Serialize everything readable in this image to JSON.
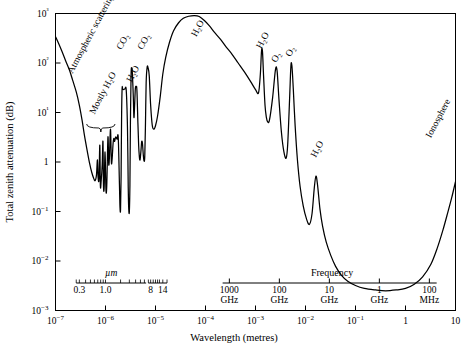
{
  "chart_data": {
    "type": "line",
    "title": "",
    "xlabel": "Wavelength (metres)",
    "ylabel": "Total zenith attenuation (dB)",
    "xscale": "log",
    "yscale": "log",
    "xlim": [
      1e-07,
      10
    ],
    "ylim": [
      0.001,
      1000
    ],
    "grid": false,
    "legend": "none",
    "x_tick_labels": [
      "10−7",
      "10−6",
      "10−5",
      "10−4",
      "10−3",
      "10−2",
      "10−1",
      "1",
      "10"
    ],
    "x_tick_values": [
      1e-07,
      1e-06,
      1e-05,
      0.0001,
      0.001,
      0.01,
      0.1,
      1,
      10
    ],
    "y_tick_labels": [
      "10−3",
      "10−2",
      "10−1",
      "1",
      "10¹",
      "10²",
      "10³"
    ],
    "y_tick_values": [
      0.001,
      0.01,
      0.1,
      1,
      10,
      100,
      1000
    ],
    "secondary_axes": [
      {
        "name": "micrometre-scale",
        "label": "µm",
        "ticks": [
          {
            "label": "0.3",
            "wavelength": 3e-07
          },
          {
            "label": "1.0",
            "wavelength": 1e-06
          },
          {
            "label": "8",
            "wavelength": 8e-06
          },
          {
            "label": "14",
            "wavelength": 1.4e-05
          }
        ]
      },
      {
        "name": "frequency-scale",
        "label": "Frequency",
        "ticks": [
          {
            "label": "1000",
            "unit": "GHz",
            "wavelength": 0.0003
          },
          {
            "label": "100",
            "unit": "GHz",
            "wavelength": 0.003
          },
          {
            "label": "10",
            "unit": "GHz",
            "wavelength": 0.03
          },
          {
            "label": "1",
            "unit": "GHz",
            "wavelength": 0.3
          },
          {
            "label": "100",
            "unit": "MHz",
            "wavelength": 3.0
          }
        ]
      }
    ],
    "annotations": [
      {
        "text": "Atmospheric scattering",
        "name": "annotation-atmospheric-scattering",
        "x": 2.2e-07,
        "y": 60,
        "rotate": -62
      },
      {
        "text": "Mostly H₂O",
        "name": "annotation-mostly-h2o",
        "x": 6e-07,
        "y": 9,
        "rotate": -62
      },
      {
        "text": "CO₂",
        "name": "annotation-co2-1",
        "x": 2.1e-06,
        "y": 180,
        "rotate": -62
      },
      {
        "text": "H₂O",
        "name": "annotation-h2o-ir",
        "x": 3.3e-06,
        "y": 40,
        "rotate": -62
      },
      {
        "text": "CO₂",
        "name": "annotation-co2-2",
        "x": 5.5e-06,
        "y": 180,
        "rotate": -62
      },
      {
        "text": "H₂O",
        "name": "annotation-h2o-submm",
        "x": 6.5e-05,
        "y": 330,
        "rotate": -62
      },
      {
        "text": "H₂O",
        "name": "annotation-h2o-183",
        "x": 0.0013,
        "y": 190,
        "rotate": -62
      },
      {
        "text": "O₂",
        "name": "annotation-o2-1",
        "x": 0.0026,
        "y": 100,
        "rotate": -62
      },
      {
        "text": "O₂",
        "name": "annotation-o2-2",
        "x": 0.005,
        "y": 130,
        "rotate": -62
      },
      {
        "text": "H₂O",
        "name": "annotation-h2o-22",
        "x": 0.016,
        "y": 1.2,
        "rotate": -62
      },
      {
        "text": "Ionosphere",
        "name": "annotation-ionosphere",
        "x": 3.2,
        "y": 3.0,
        "rotate": -62
      }
    ],
    "series": [
      {
        "name": "Total zenith attenuation",
        "points": [
          [
            1e-07,
            340
          ],
          [
            1.15e-07,
            250
          ],
          [
            1.35e-07,
            170
          ],
          [
            1.6e-07,
            110
          ],
          [
            1.9e-07,
            72
          ],
          [
            2.2e-07,
            45
          ],
          [
            2.6e-07,
            26
          ],
          [
            3e-07,
            14
          ],
          [
            3.4e-07,
            7.0
          ],
          [
            3.8e-07,
            3.4
          ],
          [
            4.3e-07,
            1.7
          ],
          [
            4.8e-07,
            0.95
          ],
          [
            5.3e-07,
            0.62
          ],
          [
            5.8e-07,
            0.47
          ],
          [
            6.2e-07,
            0.42
          ],
          [
            6.6e-07,
            0.55
          ],
          [
            6.9e-07,
            1.1
          ],
          [
            7.1e-07,
            0.5
          ],
          [
            7.4e-07,
            0.45
          ],
          [
            7.7e-07,
            2.2
          ],
          [
            7.9e-07,
            0.33
          ],
          [
            8.2e-07,
            0.42
          ],
          [
            8.6e-07,
            0.9
          ],
          [
            8.9e-07,
            2.6
          ],
          [
            9.1e-07,
            0.35
          ],
          [
            9.4e-07,
            0.3
          ],
          [
            9.8e-07,
            1.6
          ],
          [
            1.02e-06,
            0.28
          ],
          [
            1.06e-06,
            0.33
          ],
          [
            1.12e-06,
            3.2
          ],
          [
            1.16e-06,
            0.9
          ],
          [
            1.2e-06,
            1.3
          ],
          [
            1.26e-06,
            4.6
          ],
          [
            1.31e-06,
            1.0
          ],
          [
            1.36e-06,
            1.2
          ],
          [
            1.42e-06,
            2.4
          ],
          [
            1.47e-06,
            3.0
          ],
          [
            1.52e-06,
            2.6
          ],
          [
            1.6e-06,
            3.2
          ],
          [
            1.7e-06,
            2.9
          ],
          [
            1.8e-06,
            3.1
          ],
          [
            1.9e-06,
            0.35
          ],
          [
            1.95e-06,
            0.12
          ],
          [
            2e-06,
            0.11
          ],
          [
            2.05e-06,
            0.5
          ],
          [
            2.1e-06,
            9
          ],
          [
            2.15e-06,
            31
          ],
          [
            2.2e-06,
            30
          ],
          [
            2.3e-06,
            29
          ],
          [
            2.45e-06,
            30
          ],
          [
            2.6e-06,
            28
          ],
          [
            2.75e-06,
            5.0
          ],
          [
            2.85e-06,
            0.3
          ],
          [
            2.92e-06,
            0.11
          ],
          [
            3e-06,
            0.1
          ],
          [
            3.08e-06,
            0.35
          ],
          [
            3.15e-06,
            6
          ],
          [
            3.25e-06,
            60
          ],
          [
            3.35e-06,
            78
          ],
          [
            3.45e-06,
            62
          ],
          [
            3.6e-06,
            20
          ],
          [
            3.7e-06,
            8
          ],
          [
            3.8e-06,
            12
          ],
          [
            3.95e-06,
            30
          ],
          [
            4.1e-06,
            33
          ],
          [
            4.25e-06,
            28
          ],
          [
            4.45e-06,
            6
          ],
          [
            4.6e-06,
            2.2
          ],
          [
            4.75e-06,
            1.3
          ],
          [
            4.9e-06,
            1.1
          ],
          [
            5.1e-06,
            1.6
          ],
          [
            5.3e-06,
            2.6
          ],
          [
            5.5e-06,
            2.3
          ],
          [
            5.7e-06,
            1.4
          ],
          [
            5.9e-06,
            1.05
          ],
          [
            6.1e-06,
            1.3
          ],
          [
            6.3e-06,
            6
          ],
          [
            6.5e-06,
            40
          ],
          [
            6.8e-06,
            82
          ],
          [
            7.1e-06,
            80
          ],
          [
            7.5e-06,
            55
          ],
          [
            8e-06,
            14
          ],
          [
            8.6e-06,
            5.6
          ],
          [
            9.2e-06,
            4.6
          ],
          [
            1e-05,
            5.4
          ],
          [
            1.1e-05,
            8.5
          ],
          [
            1.25e-05,
            22
          ],
          [
            1.4e-05,
            60
          ],
          [
            1.6e-05,
            130
          ],
          [
            1.9e-05,
            260
          ],
          [
            2.3e-05,
            450
          ],
          [
            2.9e-05,
            650
          ],
          [
            3.6e-05,
            800
          ],
          [
            4.6e-05,
            880
          ],
          [
            6e-05,
            910
          ],
          [
            7.5e-05,
            870
          ],
          [
            9.5e-05,
            720
          ],
          [
            0.00012,
            560
          ],
          [
            0.00015,
            420
          ],
          [
            0.0002,
            300
          ],
          [
            0.00026,
            210
          ],
          [
            0.00034,
            150
          ],
          [
            0.00045,
            100
          ],
          [
            0.0006,
            66
          ],
          [
            0.0008,
            42
          ],
          [
            0.001,
            29
          ],
          [
            0.00115,
            25
          ],
          [
            0.00125,
            60
          ],
          [
            0.00132,
            175
          ],
          [
            0.00138,
            170
          ],
          [
            0.00145,
            55
          ],
          [
            0.00155,
            14
          ],
          [
            0.00165,
            8
          ],
          [
            0.00175,
            6.5
          ],
          [
            0.0019,
            7
          ],
          [
            0.0022,
            20
          ],
          [
            0.0025,
            72
          ],
          [
            0.0027,
            70
          ],
          [
            0.00295,
            18
          ],
          [
            0.0033,
            4.0
          ],
          [
            0.0037,
            1.6
          ],
          [
            0.0041,
            1.2
          ],
          [
            0.0044,
            2.2
          ],
          [
            0.0048,
            18
          ],
          [
            0.0051,
            85
          ],
          [
            0.00535,
            88
          ],
          [
            0.0057,
            30
          ],
          [
            0.0062,
            5.5
          ],
          [
            0.0069,
            1.1
          ],
          [
            0.0078,
            0.32
          ],
          [
            0.009,
            0.13
          ],
          [
            0.0105,
            0.07
          ],
          [
            0.012,
            0.055
          ],
          [
            0.0135,
            0.09
          ],
          [
            0.015,
            0.3
          ],
          [
            0.0162,
            0.52
          ],
          [
            0.0175,
            0.33
          ],
          [
            0.0195,
            0.11
          ],
          [
            0.022,
            0.05
          ],
          [
            0.026,
            0.024
          ],
          [
            0.032,
            0.013
          ],
          [
            0.04,
            0.0078
          ],
          [
            0.052,
            0.0052
          ],
          [
            0.07,
            0.0039
          ],
          [
            0.1,
            0.0032
          ],
          [
            0.15,
            0.0028
          ],
          [
            0.25,
            0.0026
          ],
          [
            0.4,
            0.0025
          ],
          [
            0.65,
            0.0026
          ],
          [
            1.0,
            0.0028
          ],
          [
            1.5,
            0.0034
          ],
          [
            2.2,
            0.0048
          ],
          [
            3.2,
            0.0085
          ],
          [
            4.3,
            0.018
          ],
          [
            5.6,
            0.042
          ],
          [
            7.0,
            0.095
          ],
          [
            8.4,
            0.19
          ],
          [
            10.0,
            0.4
          ]
        ]
      }
    ]
  }
}
